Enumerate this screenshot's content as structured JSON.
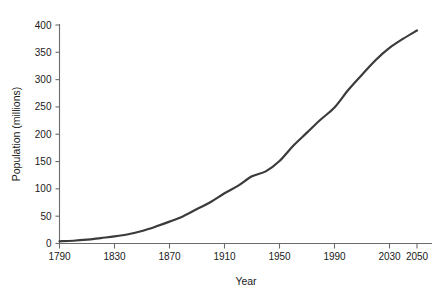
{
  "chart_data": {
    "type": "line",
    "title": "",
    "xlabel": "Year",
    "ylabel": "Population (millions)",
    "xlim": [
      1780,
      2055
    ],
    "ylim": [
      0,
      400
    ],
    "grid": false,
    "legend": "none",
    "line_color": "#3b3b3b",
    "axis_color": "#6b6b6b",
    "x_ticks": [
      1790,
      1830,
      1870,
      1910,
      1950,
      1990,
      2030,
      2050
    ],
    "x_tick_labels": [
      "1790",
      "1830",
      "1870",
      "1910",
      "1950",
      "1990",
      "2030",
      "2050"
    ],
    "y_ticks": [
      0,
      50,
      100,
      150,
      200,
      250,
      300,
      350,
      400
    ],
    "y_tick_labels": [
      "0",
      "50",
      "100",
      "150",
      "200",
      "250",
      "300",
      "350",
      "400"
    ],
    "series": [
      {
        "name": "Population",
        "x": [
          1790,
          1800,
          1810,
          1820,
          1830,
          1840,
          1850,
          1860,
          1870,
          1880,
          1890,
          1900,
          1910,
          1920,
          1930,
          1940,
          1950,
          1960,
          1970,
          1980,
          1990,
          2000,
          2010,
          2020,
          2030,
          2040,
          2050
        ],
        "values": [
          4,
          5,
          7,
          10,
          13,
          17,
          23,
          31,
          40,
          50,
          63,
          76,
          92,
          106,
          123,
          132,
          151,
          179,
          203,
          227,
          249,
          281,
          309,
          336,
          358,
          375,
          390
        ]
      }
    ]
  },
  "figure": {
    "background_color": "#ffffff",
    "width": 445,
    "height": 291
  }
}
